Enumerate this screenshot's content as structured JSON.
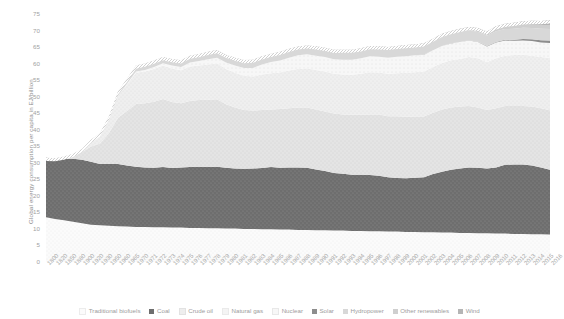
{
  "chart_data": {
    "type": "area",
    "stacked": true,
    "title": "",
    "xlabel": "",
    "ylabel": "Global energy consumption per capita in EJ/billion",
    "ylim": [
      0,
      75
    ],
    "ytick_step": 5,
    "ytick_labels": [
      "0",
      "5",
      "10",
      "15",
      "20",
      "25",
      "30",
      "35",
      "40",
      "45",
      "50",
      "55",
      "60",
      "65",
      "70",
      "75"
    ],
    "grid": false,
    "legend_position": "bottom",
    "x": [
      1800,
      1820,
      1850,
      1880,
      1900,
      1920,
      1930,
      1950,
      1960,
      1965,
      1970,
      1971,
      1972,
      1973,
      1974,
      1975,
      1976,
      1977,
      1978,
      1979,
      1980,
      1981,
      1982,
      1983,
      1984,
      1985,
      1986,
      1987,
      1988,
      1989,
      1990,
      1991,
      1992,
      1993,
      1994,
      1995,
      1996,
      1997,
      1998,
      1999,
      2000,
      2001,
      2002,
      2003,
      2004,
      2005,
      2006,
      2007,
      2008,
      2009,
      2010,
      2011,
      2012,
      2013,
      2014,
      2015,
      2016
    ],
    "xtick_labels": [
      "1800",
      "1820",
      "1850",
      "1880",
      "1900",
      "1920",
      "1930",
      "1950",
      "1960",
      "1965",
      "1970",
      "1971",
      "1972",
      "1973",
      "1974",
      "1975",
      "1976",
      "1977",
      "1978",
      "1979",
      "1980",
      "1981",
      "1982",
      "1983",
      "1984",
      "1985",
      "1986",
      "1987",
      "1988",
      "1989",
      "1990",
      "1991",
      "1992",
      "1993",
      "1994",
      "1995",
      "1996",
      "1997",
      "1998",
      "1999",
      "2000",
      "2001",
      "2002",
      "2003",
      "2004",
      "2005",
      "2006",
      "2007",
      "2008",
      "2009",
      "2010",
      "2011",
      "2012",
      "2013",
      "2014",
      "2015",
      "2016"
    ],
    "series": [
      {
        "name": "Traditional biofuels",
        "color": "#fafafa",
        "values": [
          13.5,
          13.0,
          12.6,
          12.2,
          11.7,
          11.3,
          11.1,
          11.0,
          10.8,
          10.7,
          10.6,
          10.6,
          10.5,
          10.5,
          10.4,
          10.4,
          10.3,
          10.3,
          10.2,
          10.2,
          10.1,
          10.1,
          10.0,
          10.0,
          9.9,
          9.9,
          9.8,
          9.8,
          9.7,
          9.7,
          9.6,
          9.6,
          9.5,
          9.5,
          9.4,
          9.4,
          9.3,
          9.3,
          9.2,
          9.2,
          9.1,
          9.1,
          9.0,
          9.0,
          8.9,
          8.9,
          8.8,
          8.8,
          8.7,
          8.7,
          8.6,
          8.6,
          8.5,
          8.5,
          8.4,
          8.4,
          8.3
        ]
      },
      {
        "name": "Coal",
        "color": "#6e6e6e",
        "values": [
          18.0,
          18.2,
          18.6,
          19.0,
          19.2,
          19.0,
          18.5,
          18.6,
          18.8,
          18.5,
          18.2,
          18.0,
          18.0,
          18.2,
          18.0,
          18.2,
          18.4,
          18.5,
          18.5,
          18.6,
          18.4,
          18.2,
          18.2,
          18.3,
          18.5,
          18.8,
          18.7,
          18.8,
          18.9,
          18.8,
          18.4,
          17.9,
          17.4,
          17.2,
          17.0,
          17.0,
          17.0,
          16.8,
          16.4,
          16.2,
          16.2,
          16.4,
          16.6,
          17.6,
          18.4,
          19.0,
          19.5,
          19.8,
          19.8,
          19.6,
          20.0,
          20.8,
          21.0,
          21.0,
          20.8,
          20.2,
          19.6
        ]
      },
      {
        "name": "Crude oil",
        "color": "#e3e3e3",
        "values": [
          0.0,
          0.2,
          0.6,
          1.2,
          2.4,
          4.6,
          6.2,
          9.4,
          14.0,
          16.5,
          19.0,
          19.4,
          20.0,
          20.6,
          20.0,
          19.4,
          20.0,
          20.2,
          20.4,
          20.4,
          19.2,
          18.4,
          17.8,
          17.5,
          17.6,
          17.4,
          17.8,
          17.9,
          18.1,
          18.2,
          18.1,
          18.0,
          18.0,
          17.9,
          18.1,
          18.1,
          18.3,
          18.5,
          18.5,
          18.7,
          18.6,
          18.5,
          18.4,
          18.5,
          18.8,
          18.8,
          18.7,
          18.6,
          18.2,
          17.7,
          17.9,
          17.8,
          17.7,
          17.7,
          17.8,
          17.9,
          18.0
        ]
      },
      {
        "name": "Natural gas",
        "color": "#f0f0f0",
        "values": [
          0.0,
          0.0,
          0.1,
          0.3,
          0.8,
          1.8,
          2.6,
          4.2,
          6.6,
          8.0,
          9.4,
          9.6,
          9.9,
          10.1,
          10.1,
          10.0,
          10.4,
          10.4,
          10.6,
          10.9,
          10.7,
          10.5,
          10.3,
          10.3,
          10.7,
          11.0,
          11.0,
          11.4,
          11.7,
          11.9,
          12.0,
          12.1,
          12.0,
          12.1,
          12.1,
          12.4,
          12.8,
          12.7,
          12.8,
          13.0,
          13.3,
          13.4,
          13.6,
          13.9,
          14.1,
          14.3,
          14.4,
          14.8,
          14.9,
          14.4,
          15.1,
          15.2,
          15.4,
          15.5,
          15.4,
          15.5,
          15.8
        ]
      },
      {
        "name": "Nuclear",
        "color": "#f6f6f6",
        "values": [
          0.0,
          0.0,
          0.0,
          0.0,
          0.0,
          0.0,
          0.0,
          0.0,
          0.1,
          0.2,
          0.4,
          0.5,
          0.6,
          0.7,
          0.9,
          1.0,
          1.2,
          1.4,
          1.6,
          1.7,
          1.9,
          2.2,
          2.4,
          2.6,
          3.0,
          3.4,
          3.6,
          3.9,
          4.1,
          4.2,
          4.3,
          4.4,
          4.4,
          4.5,
          4.6,
          4.7,
          4.8,
          4.8,
          4.9,
          5.0,
          5.0,
          5.1,
          5.1,
          5.0,
          5.1,
          5.1,
          5.1,
          5.0,
          4.9,
          4.8,
          4.8,
          4.6,
          4.3,
          4.3,
          4.4,
          4.4,
          4.5
        ]
      },
      {
        "name": "Solar",
        "color": "#8d8d8d",
        "values": [
          0,
          0,
          0,
          0,
          0,
          0,
          0,
          0,
          0,
          0,
          0,
          0,
          0,
          0,
          0,
          0,
          0,
          0,
          0,
          0,
          0,
          0,
          0,
          0,
          0,
          0,
          0,
          0,
          0,
          0,
          0,
          0,
          0,
          0,
          0,
          0,
          0,
          0,
          0,
          0,
          0.01,
          0.01,
          0.02,
          0.02,
          0.03,
          0.04,
          0.05,
          0.07,
          0.09,
          0.12,
          0.17,
          0.25,
          0.33,
          0.42,
          0.53,
          0.65,
          0.8
        ]
      },
      {
        "name": "Hydropower",
        "color": "#d8d8d8",
        "values": [
          0.0,
          0.0,
          0.0,
          0.0,
          0.1,
          0.3,
          0.5,
          0.9,
          1.3,
          1.5,
          1.7,
          1.8,
          1.8,
          1.8,
          1.9,
          1.9,
          2.0,
          2.0,
          2.1,
          2.1,
          2.2,
          2.2,
          2.2,
          2.3,
          2.3,
          2.3,
          2.4,
          2.4,
          2.4,
          2.4,
          2.5,
          2.5,
          2.5,
          2.6,
          2.6,
          2.6,
          2.7,
          2.7,
          2.7,
          2.7,
          2.8,
          2.7,
          2.8,
          2.8,
          2.9,
          2.9,
          3.0,
          3.0,
          3.0,
          3.1,
          3.2,
          3.2,
          3.3,
          3.4,
          3.4,
          3.5,
          3.5
        ]
      },
      {
        "name": "Other renewables",
        "color": "#cfcfcf",
        "values": [
          0.0,
          0.0,
          0.0,
          0.0,
          0.0,
          0.0,
          0.0,
          0.0,
          0.0,
          0.0,
          0.1,
          0.1,
          0.1,
          0.1,
          0.1,
          0.1,
          0.1,
          0.1,
          0.2,
          0.2,
          0.2,
          0.2,
          0.2,
          0.2,
          0.2,
          0.2,
          0.3,
          0.3,
          0.3,
          0.3,
          0.3,
          0.3,
          0.4,
          0.4,
          0.4,
          0.4,
          0.4,
          0.4,
          0.5,
          0.5,
          0.5,
          0.5,
          0.5,
          0.6,
          0.6,
          0.6,
          0.7,
          0.7,
          0.8,
          0.8,
          0.9,
          0.9,
          1.0,
          1.0,
          1.1,
          1.1,
          1.2
        ]
      },
      {
        "name": "Wind",
        "color": "#b5b5b5",
        "values": [
          0,
          0,
          0,
          0,
          0,
          0,
          0,
          0,
          0,
          0,
          0,
          0,
          0,
          0,
          0,
          0,
          0,
          0,
          0,
          0,
          0,
          0,
          0,
          0,
          0,
          0,
          0,
          0,
          0,
          0,
          0.01,
          0.01,
          0.01,
          0.02,
          0.02,
          0.03,
          0.03,
          0.04,
          0.05,
          0.06,
          0.08,
          0.09,
          0.11,
          0.13,
          0.17,
          0.21,
          0.26,
          0.33,
          0.41,
          0.5,
          0.6,
          0.72,
          0.84,
          0.97,
          1.1,
          1.25,
          1.4
        ]
      }
    ]
  },
  "legend": {
    "items": [
      {
        "label": "Traditional biofuels",
        "swatch": "sw-dots"
      },
      {
        "label": "Coal",
        "swatch": "sw-solid-dark"
      },
      {
        "label": "Crude oil",
        "swatch": "sw-light"
      },
      {
        "label": "Natural gas",
        "swatch": "sw-nat"
      },
      {
        "label": "Nuclear",
        "swatch": "sw-nuc"
      },
      {
        "label": "Solar",
        "swatch": "sw-solar"
      },
      {
        "label": "Hydropower",
        "swatch": "sw-hydro"
      },
      {
        "label": "Other renewables",
        "swatch": "sw-other"
      },
      {
        "label": "Wind",
        "swatch": "sw-wind"
      }
    ]
  }
}
